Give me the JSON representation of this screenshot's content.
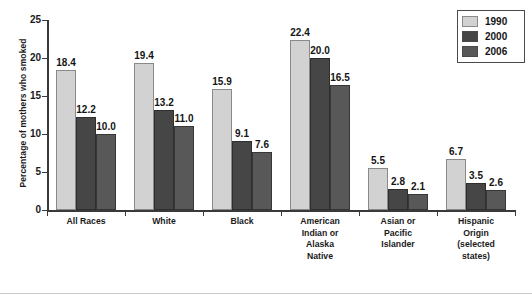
{
  "chart_data": {
    "type": "bar",
    "title": "",
    "xlabel": "",
    "ylabel": "Percentage of mothers who smoked",
    "ylim": [
      0,
      25
    ],
    "yticks": [
      0,
      5,
      10,
      15,
      20,
      25
    ],
    "grid": false,
    "legend_position": "top-right",
    "categories": [
      "All Races",
      "White",
      "Black",
      "American Indian or Alaska Native",
      "Asian or Pacific Islander",
      "Hispanic Origin (selected states)"
    ],
    "category_lines": [
      [
        "All Races"
      ],
      [
        "White"
      ],
      [
        "Black"
      ],
      [
        "American",
        "Indian or",
        "Alaska",
        "Native"
      ],
      [
        "Asian or",
        "Pacific",
        "Islander"
      ],
      [
        "Hispanic",
        "Origin",
        "(selected",
        "states)"
      ]
    ],
    "series": [
      {
        "name": "1990",
        "color": "#d2d2d2",
        "values": [
          18.4,
          19.4,
          15.9,
          22.4,
          5.5,
          6.7
        ],
        "labels": [
          "18.4",
          "19.4",
          "15.9",
          "22.4",
          "5.5",
          "6.7"
        ]
      },
      {
        "name": "2000",
        "color": "#464646",
        "values": [
          12.2,
          13.2,
          9.1,
          20.0,
          2.8,
          3.5
        ],
        "labels": [
          "12.2",
          "13.2",
          "9.1",
          "20.0",
          "2.8",
          "3.5"
        ]
      },
      {
        "name": "2006",
        "color": "#585858",
        "values": [
          10.0,
          11.0,
          7.6,
          16.5,
          2.1,
          2.6
        ],
        "labels": [
          "10.0",
          "11.0",
          "7.6",
          "16.5",
          "2.1",
          "2.6"
        ]
      }
    ]
  },
  "legend": {
    "entries": [
      {
        "label": "1990"
      },
      {
        "label": "2000"
      },
      {
        "label": "2006"
      }
    ]
  },
  "axes": {
    "y_title": "Percentage of mothers who smoked",
    "y_tick_labels": [
      "25",
      "20",
      "15",
      "10",
      "5",
      "0"
    ]
  }
}
